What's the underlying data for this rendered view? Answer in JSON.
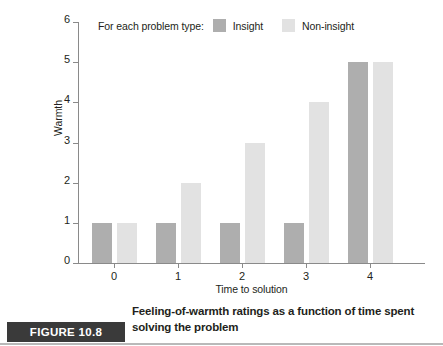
{
  "chart_data": {
    "type": "bar",
    "title": "",
    "xlabel": "Time to solution",
    "ylabel": "Warmth",
    "categories": [
      "0",
      "1",
      "2",
      "3",
      "4"
    ],
    "x": [
      0,
      1,
      2,
      3,
      4
    ],
    "series": [
      {
        "name": "Insight",
        "values": [
          1,
          1,
          1,
          1,
          5
        ],
        "color": "#aeaeae"
      },
      {
        "name": "Non-insight",
        "values": [
          1,
          2,
          3,
          4,
          5
        ],
        "color": "#e2e2e2"
      }
    ],
    "ylim": [
      0,
      6
    ],
    "yticks": [
      0,
      1,
      2,
      3,
      4,
      5,
      6
    ],
    "ytick_labels": [
      "0",
      "1",
      "2",
      "3",
      "4",
      "5",
      "6"
    ],
    "xtick_labels": [
      "0",
      "1",
      "2",
      "3",
      "4"
    ],
    "grid": false,
    "legend_position": "top-center",
    "legend_intro": "For each problem type:"
  },
  "legend": {
    "intro": "For each problem type:",
    "entries": [
      {
        "label": "Insight",
        "color": "#aeaeae"
      },
      {
        "label": "Non-insight",
        "color": "#e2e2e2"
      }
    ]
  },
  "axes": {
    "y_title": "Warmth",
    "x_title": "Time to solution",
    "y_ticks": [
      "0",
      "1",
      "2",
      "3",
      "4",
      "5",
      "6"
    ],
    "x_ticks": [
      "0",
      "1",
      "2",
      "3",
      "4"
    ]
  },
  "caption": {
    "badge": "FIGURE 10.8",
    "text": "Feeling-of-warmth ratings as a function of time spent solving the problem"
  },
  "colors": {
    "insight_bar": "#aeaeae",
    "noninsight_bar": "#e2e2e2",
    "axis": "#8a8a8a",
    "badge_background": "#3a3a3a",
    "text": "#231f20",
    "rule": "#b9b9b9"
  }
}
